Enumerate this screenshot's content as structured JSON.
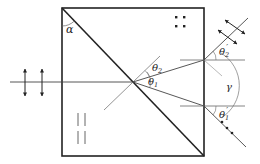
{
  "diagram": {
    "labels": {
      "alpha": "α",
      "theta2": "θ",
      "theta2_sub": "2",
      "theta1": "θ",
      "theta1_sub": "1",
      "theta2_prime": "θ",
      "theta2_prime_sub": "2",
      "theta2_prime_mark": "′",
      "theta1_prime": "θ",
      "theta1_prime_sub": "1",
      "theta1_prime_mark": "′",
      "gamma": "γ"
    },
    "symbols": {
      "incident_polarization": "vertical double arrows",
      "optic_axis_first_prism": "parallel vertical lines",
      "optic_axis_second_prism": "dots (perpendicular to page)",
      "upper_exit_polarization": "double arrows perpendicular to ray",
      "lower_exit_polarization": "dots along ray"
    },
    "colors": {
      "line": "#222222",
      "thin_line": "#555555",
      "background": "#ffffff"
    }
  }
}
